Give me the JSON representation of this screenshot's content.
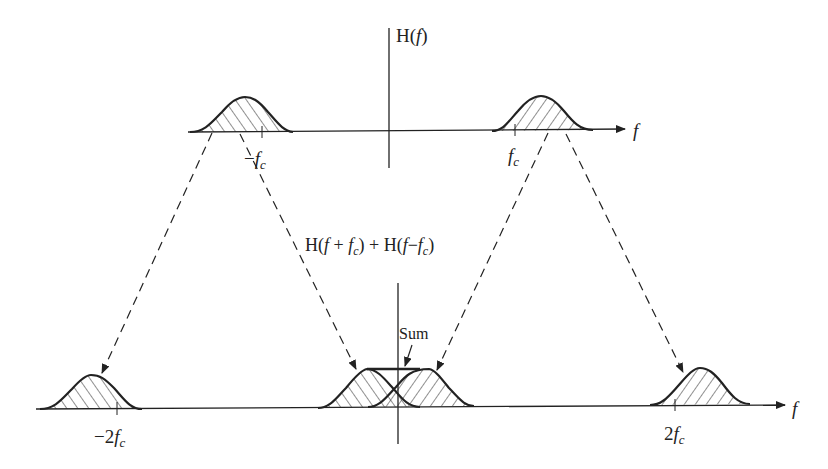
{
  "diagram": {
    "top_axis": {
      "y_label": "H(f)",
      "x_label": "f",
      "ticks": [
        {
          "label_main": "−f",
          "label_sub": "c",
          "x": 262
        },
        {
          "label_main": "f",
          "label_sub": "c",
          "x": 515
        }
      ]
    },
    "bottom_axis": {
      "y_label": "H(f + fc) + H(f − fc)",
      "y_label_parts": [
        "H(",
        "f",
        " + ",
        "f",
        "c",
        ") + H(",
        "f",
        "−",
        "f",
        "c",
        ")"
      ],
      "x_label": "f",
      "ticks": [
        {
          "label_main": "−2f",
          "label_sub": "c",
          "x": 117
        },
        {
          "label_main": "2f",
          "label_sub": "c",
          "x": 680
        }
      ],
      "annotation": "Sum"
    },
    "colors": {
      "line": "#222222",
      "background": "#ffffff"
    }
  }
}
